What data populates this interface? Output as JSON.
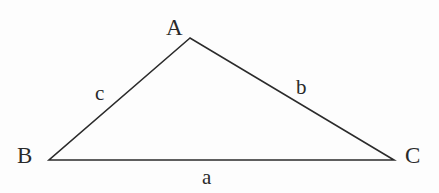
{
  "figure": {
    "kind": "geometry-diagram",
    "background_color": "#fdfdfd",
    "stroke_color": "#2b2b2b",
    "text_color": "#2a2a2a",
    "stroke_width": 1.6,
    "canvas": {
      "width": 439,
      "height": 193
    }
  },
  "triangle": {
    "vertices": [
      {
        "name": "A",
        "label": "A",
        "x": 190,
        "y": 38
      },
      {
        "name": "B",
        "label": "B",
        "x": 49,
        "y": 160
      },
      {
        "name": "C",
        "label": "C",
        "x": 394,
        "y": 160
      }
    ],
    "points_path": "190,38 49,160 394,160",
    "sides": [
      {
        "name": "a",
        "label": "a",
        "from": "B",
        "to": "C"
      },
      {
        "name": "b",
        "label": "b",
        "from": "A",
        "to": "C"
      },
      {
        "name": "c",
        "label": "c",
        "from": "A",
        "to": "B"
      }
    ]
  },
  "labels": {
    "vertex_a": "A",
    "vertex_b": "B",
    "vertex_c": "C",
    "side_a": "a",
    "side_b": "b",
    "side_c": "c"
  }
}
